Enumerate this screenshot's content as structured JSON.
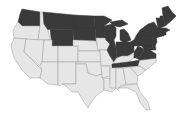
{
  "map": {
    "type": "choropleth",
    "region": "United States (contiguous)",
    "colors": {
      "highlighted": "#3a3a3a",
      "default": "#e6e6e6",
      "border": "#9a9a9a",
      "background": "#ffffff"
    },
    "highlighted_states": [
      "WA",
      "MT",
      "WY",
      "ND",
      "SD",
      "MN",
      "WI",
      "IL",
      "MI",
      "IN",
      "OH",
      "PA",
      "NY",
      "VT",
      "NH",
      "ME",
      "MA",
      "CT",
      "RI",
      "NJ",
      "DE",
      "MD",
      "WV",
      "VA",
      "TN"
    ],
    "default_states": [
      "OR",
      "ID",
      "CA",
      "NV",
      "UT",
      "AZ",
      "CO",
      "NM",
      "NE",
      "KS",
      "OK",
      "TX",
      "IA",
      "MO",
      "AR",
      "LA",
      "KY",
      "MS",
      "AL",
      "GA",
      "FL",
      "SC",
      "NC"
    ]
  }
}
